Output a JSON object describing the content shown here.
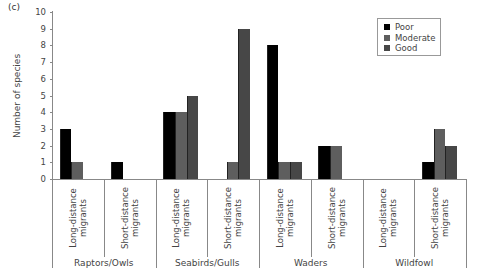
{
  "panel_label": "(c)",
  "colors": {
    "Poor": "#000000",
    "Moderate": "#5e5e5e",
    "Good": "#474747"
  },
  "chart_data": {
    "type": "bar",
    "title": "",
    "xlabel": "",
    "ylabel": "Number of species",
    "ylim": [
      0,
      10
    ],
    "yticks": [
      0,
      1,
      2,
      3,
      4,
      5,
      6,
      7,
      8,
      9,
      10
    ],
    "grid": false,
    "legend_position": "upper right",
    "groups": [
      {
        "name": "Raptors/Owls",
        "subcategories": [
          "Long-distance migrants",
          "Short-distance migrants"
        ]
      },
      {
        "name": "Seabirds/Gulls",
        "subcategories": [
          "Long-distance migrants",
          "Short-distance migrants"
        ]
      },
      {
        "name": "Waders",
        "subcategories": [
          "Long-distance migrants",
          "Short-distance migrants"
        ]
      },
      {
        "name": "Wildfowl",
        "subcategories": [
          "Long-distance migrants",
          "Short-distance migrants"
        ]
      }
    ],
    "categories": [
      "Raptors/Owls – Long-distance migrants",
      "Raptors/Owls – Short-distance migrants",
      "Seabirds/Gulls – Long-distance migrants",
      "Seabirds/Gulls – Short-distance migrants",
      "Waders – Long-distance migrants",
      "Waders – Short-distance migrants",
      "Wildfowl – Long-distance migrants",
      "Wildfowl – Short-distance migrants"
    ],
    "series": [
      {
        "name": "Poor",
        "values": [
          3,
          1,
          4,
          0,
          8,
          2,
          0,
          1
        ]
      },
      {
        "name": "Moderate",
        "values": [
          1,
          0,
          4,
          1,
          1,
          2,
          0,
          3
        ]
      },
      {
        "name": "Good",
        "values": [
          0,
          0,
          5,
          9,
          1,
          0,
          0,
          2
        ]
      }
    ]
  },
  "sub_label_lines": {
    "long": [
      "Long-distance",
      "migrants"
    ],
    "short": [
      "Short-distance",
      "migrants"
    ]
  }
}
